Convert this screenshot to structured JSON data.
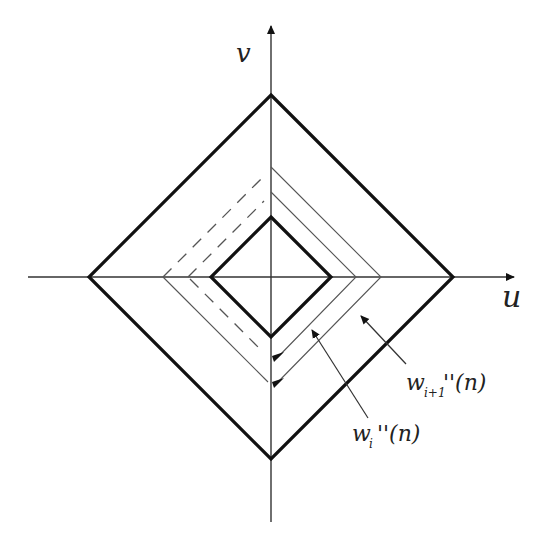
{
  "diagram": {
    "axes": {
      "horizontal_label": "u",
      "vertical_label": "v"
    },
    "labels": {
      "w_i_main": "w",
      "w_i_sub": "i",
      "w_i_rest": "''(n)",
      "w_i1_main": "w",
      "w_i1_sub": "i+1",
      "w_i1_rest": "''(n)"
    },
    "shapes": [
      {
        "name": "outer-bold-diamond",
        "style": "bold",
        "half_size": 182
      },
      {
        "name": "outer-thin-diamond",
        "style": "thin/dashed",
        "half_size": 110
      },
      {
        "name": "inner-thin-diamond",
        "style": "thin/dashed",
        "half_size": 85
      },
      {
        "name": "inner-bold-diamond",
        "style": "bold",
        "half_size": 60
      }
    ],
    "colors": {
      "line": "#111111",
      "thin": "#555555",
      "background": "#ffffff"
    }
  }
}
